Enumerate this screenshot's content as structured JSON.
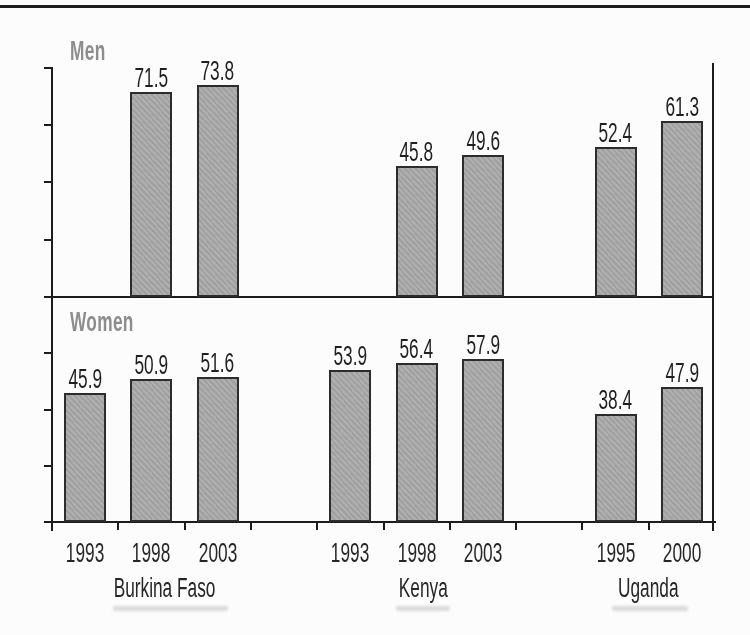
{
  "figure": {
    "background": "#fcfcfc",
    "top_rule_color": "#1c1c1c"
  },
  "chart_data": {
    "type": "bar",
    "title": "",
    "xlabel": "",
    "ylabel": "",
    "ylim": [
      0,
      80
    ],
    "tick_step": 20,
    "grid": false,
    "legend": "none",
    "axis_color": "#1c1c1c",
    "bar_fill": "#a9a9a9",
    "bar_border": "#2c2c2c",
    "panel_label_color": "#8d8d8d",
    "value_label_color": "#1f1f1f",
    "groups": [
      {
        "country": "Burkina Faso",
        "years": [
          "1993",
          "1998",
          "2003"
        ]
      },
      {
        "country": "Kenya",
        "years": [
          "1993",
          "1998",
          "2003"
        ]
      },
      {
        "country": "Uganda",
        "years": [
          "1995",
          "2000"
        ]
      }
    ],
    "panels": [
      {
        "label": "Men",
        "values_by_group": [
          [
            null,
            71.5,
            73.8
          ],
          [
            null,
            45.8,
            49.6
          ],
          [
            52.4,
            61.3
          ]
        ]
      },
      {
        "label": "Women",
        "values_by_group": [
          [
            45.9,
            50.9,
            51.6
          ],
          [
            53.9,
            56.4,
            57.9
          ],
          [
            38.4,
            47.9
          ]
        ]
      }
    ]
  }
}
